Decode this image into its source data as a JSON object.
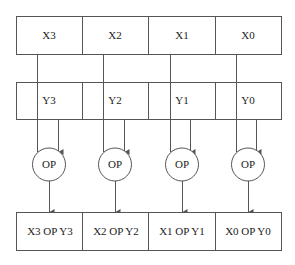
{
  "diagram": {
    "x_register": [
      "X3",
      "X2",
      "X1",
      "X0"
    ],
    "y_register": [
      "Y3",
      "Y2",
      "Y1",
      "Y0"
    ],
    "ops": [
      "OP",
      "OP",
      "OP",
      "OP"
    ],
    "results": [
      "X3 OP Y3",
      "X2 OP Y2",
      "X1 OP Y1",
      "X0 OP Y0"
    ]
  }
}
